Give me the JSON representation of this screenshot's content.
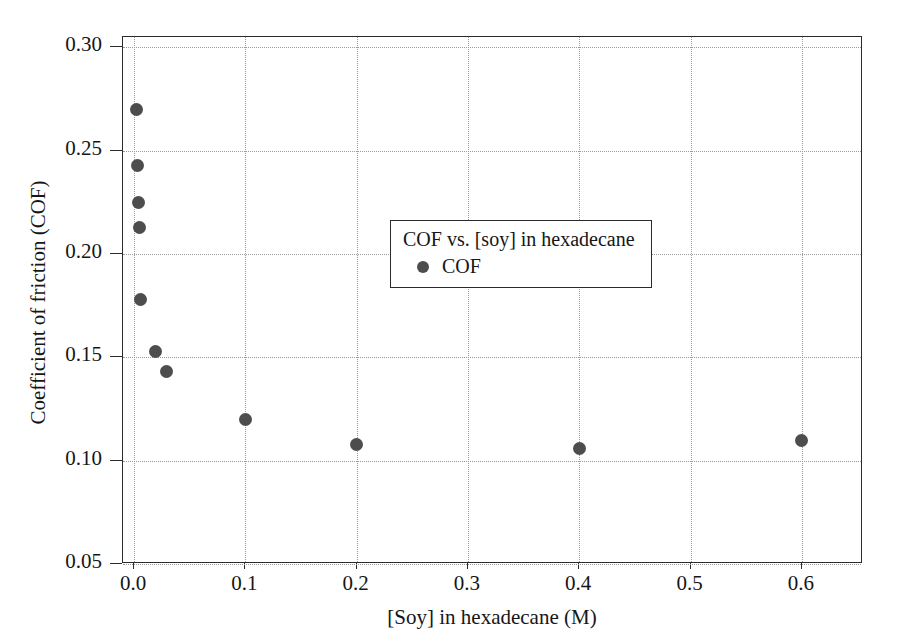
{
  "chart_data": {
    "type": "scatter",
    "title": "",
    "xlabel": "[Soy] in hexadecane (M)",
    "ylabel": "Coefficient of friction (COF)",
    "xlim": [
      -0.01,
      0.655
    ],
    "ylim": [
      0.05,
      0.305
    ],
    "grid": true,
    "legend_position": "center",
    "legend_title": "COF vs. [soy] in hexadecane",
    "xticks": [
      "0.0",
      "0.1",
      "0.2",
      "0.3",
      "0.4",
      "0.5",
      "0.6"
    ],
    "xtick_values": [
      0.0,
      0.1,
      0.2,
      0.3,
      0.4,
      0.5,
      0.6
    ],
    "yticks": [
      "0.05",
      "0.10",
      "0.15",
      "0.20",
      "0.25",
      "0.30"
    ],
    "ytick_values": [
      0.05,
      0.1,
      0.15,
      0.2,
      0.25,
      0.3
    ],
    "series": [
      {
        "name": "COF",
        "marker": "circle",
        "color": "#4d4d4d",
        "points": [
          {
            "x": 0.002,
            "y": 0.27
          },
          {
            "x": 0.003,
            "y": 0.243
          },
          {
            "x": 0.004,
            "y": 0.225
          },
          {
            "x": 0.005,
            "y": 0.213
          },
          {
            "x": 0.006,
            "y": 0.178
          },
          {
            "x": 0.019,
            "y": 0.153
          },
          {
            "x": 0.029,
            "y": 0.143
          },
          {
            "x": 0.1,
            "y": 0.12
          },
          {
            "x": 0.2,
            "y": 0.108
          },
          {
            "x": 0.4,
            "y": 0.106
          },
          {
            "x": 0.6,
            "y": 0.11
          }
        ]
      }
    ]
  },
  "legend": {
    "title": "COF vs. [soy] in hexadecane",
    "entries": [
      {
        "label": "COF"
      }
    ]
  }
}
